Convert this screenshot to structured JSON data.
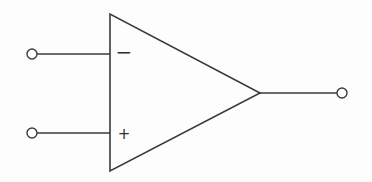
{
  "diagram": {
    "type": "op-amp-symbol",
    "stroke_color": "#3a3a3a",
    "background": "#fdfdfd",
    "amplifier": {
      "shape": "triangle",
      "vertices": [
        [
          110,
          14
        ],
        [
          110,
          171
        ],
        [
          260,
          93
        ]
      ]
    },
    "inputs": [
      {
        "name": "inverting-input",
        "sign": "−",
        "terminal": {
          "cx": 32,
          "cy": 54,
          "r": 5
        },
        "wire": {
          "x1": 37,
          "y1": 54,
          "x2": 110,
          "y2": 54
        },
        "sign_pos": {
          "x": 124,
          "y": 58
        }
      },
      {
        "name": "non-inverting-input",
        "sign": "+",
        "terminal": {
          "cx": 32,
          "cy": 133,
          "r": 5
        },
        "wire": {
          "x1": 37,
          "y1": 133,
          "x2": 110,
          "y2": 133
        },
        "sign_pos": {
          "x": 124,
          "y": 138
        }
      }
    ],
    "output": {
      "name": "output",
      "terminal": {
        "cx": 342,
        "cy": 93,
        "r": 5
      },
      "wire": {
        "x1": 260,
        "y1": 93,
        "x2": 337,
        "y2": 93
      }
    }
  }
}
